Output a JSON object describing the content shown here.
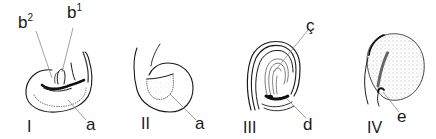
{
  "figure": {
    "panels": [
      {
        "numeral": "I",
        "callouts": [
          {
            "letter": "b",
            "superscript": "2"
          },
          {
            "letter": "b",
            "superscript": "1"
          },
          {
            "letter": "a"
          }
        ]
      },
      {
        "numeral": "II",
        "callouts": [
          {
            "letter": "a"
          }
        ]
      },
      {
        "numeral": "III",
        "callouts": [
          {
            "letter": "ç"
          },
          {
            "letter": "d"
          }
        ]
      },
      {
        "numeral": "IV",
        "callouts": [
          {
            "letter": "e"
          }
        ]
      }
    ],
    "colors": {
      "ink": "#1a1a1a",
      "leader": "#8a8a8a",
      "background": "#ffffff"
    }
  }
}
